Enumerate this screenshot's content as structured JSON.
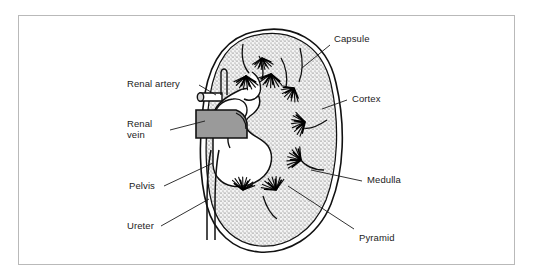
{
  "figure": {
    "frame_color": "#b9b9b9",
    "background": "#ffffff",
    "ink_color": "#1b1b1b",
    "vein_fill": "#9a9a9a",
    "cortex_fill": "#efefef"
  },
  "labels": {
    "capsule": "Capsule",
    "cortex": "Cortex",
    "medulla": "Medulla",
    "pyramid": "Pyramid",
    "renal_artery": "Renal artery",
    "renal_vein_line1": "Renal",
    "renal_vein_line2": "vein",
    "pelvis": "Pelvis",
    "ureter": "Ureter"
  },
  "structures": [
    {
      "name": "capsule",
      "side": "right",
      "description": "outer double-line membrane"
    },
    {
      "name": "cortex",
      "side": "right",
      "description": "stippled outer zone"
    },
    {
      "name": "medulla",
      "side": "right",
      "description": "inner striated zone"
    },
    {
      "name": "pyramid",
      "side": "right",
      "description": "cone-shaped medullary mass"
    },
    {
      "name": "renal-artery",
      "side": "left",
      "description": "vessel entering hilum"
    },
    {
      "name": "renal-vein",
      "side": "left",
      "description": "shaded vessel at hilum"
    },
    {
      "name": "pelvis",
      "side": "left",
      "description": "funnel collecting cavity"
    },
    {
      "name": "ureter",
      "side": "left",
      "description": "descending tube"
    }
  ]
}
